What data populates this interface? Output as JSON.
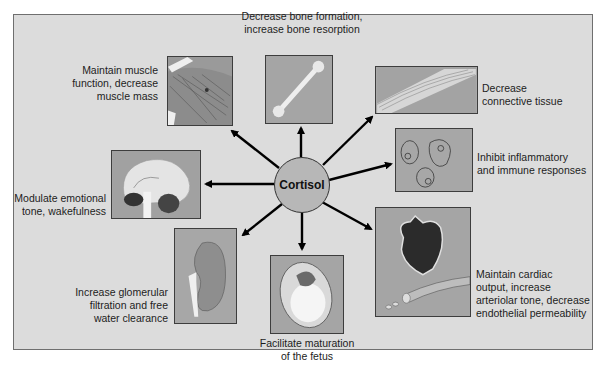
{
  "diagram": {
    "center": {
      "label": "Cortisol"
    },
    "effects": [
      {
        "id": "muscle",
        "label": "Maintain muscle\nfunction, decrease\nmuscle mass",
        "illustration": "muscle-illustration"
      },
      {
        "id": "bone",
        "label": "Decrease bone formation,\nincrease bone resorption",
        "illustration": "bone-illustration"
      },
      {
        "id": "connective",
        "label": "Decrease\nconnective tissue",
        "illustration": "connective-tissue-illustration"
      },
      {
        "id": "inflammatory",
        "label": "Inhibit inflammatory\nand immune responses",
        "illustration": "cells-illustration"
      },
      {
        "id": "brain",
        "label": "Modulate emotional\ntone, wakefulness",
        "illustration": "brain-illustration"
      },
      {
        "id": "cardiac",
        "label": "Maintain cardiac\noutput, increase\narteriolar tone, decrease\nendothelial permeability",
        "illustration": "heart-vessel-illustration"
      },
      {
        "id": "kidney",
        "label": "Increase glomerular\nfiltration and free\nwater clearance",
        "illustration": "kidney-illustration"
      },
      {
        "id": "fetus",
        "label": "Facilitate maturation\nof the fetus",
        "illustration": "fetus-illustration"
      }
    ]
  },
  "colors": {
    "background": "#dcdcdc",
    "box_fill": "#a9a9a9",
    "hub_fill": "#b7b7b7",
    "arrow": "#000000"
  }
}
